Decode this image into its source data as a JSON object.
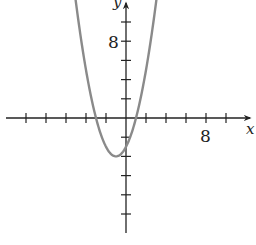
{
  "chart_data": {
    "type": "line",
    "title": "",
    "function": "y = x^2 + 2x - 3",
    "xlabel": "x",
    "ylabel": "y",
    "xlim": [
      -10,
      12
    ],
    "ylim": [
      -12,
      12
    ],
    "x_tick_step": 2,
    "y_tick_step": 2,
    "tick_labels": {
      "x": [
        "8"
      ],
      "y": [
        "8"
      ]
    },
    "grid": false,
    "legend": null,
    "series": [
      {
        "name": "parabola",
        "color": "#8a8a8a",
        "vertex": [
          -1,
          -4
        ],
        "roots": [
          -3,
          1
        ],
        "y_intercept": -3,
        "x": [
          -5.2,
          -4,
          -3,
          -2,
          -1,
          0,
          1,
          2,
          3.2
        ],
        "y": [
          13.6,
          5,
          0,
          -3,
          -4,
          -3,
          0,
          5,
          13.6
        ]
      }
    ]
  },
  "labels": {
    "x_axis": "x",
    "y_axis": "y",
    "x_tick_8": "8",
    "y_tick_8": "8"
  }
}
